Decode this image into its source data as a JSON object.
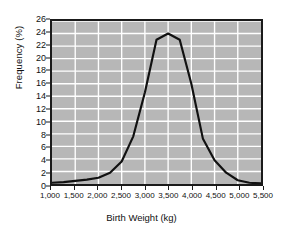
{
  "chart_data": {
    "type": "line",
    "title": "",
    "xlabel": "Birth Weight (kg)",
    "ylabel": "Frequency (%)",
    "xlim": [
      1000,
      5500
    ],
    "ylim": [
      0,
      26
    ],
    "xticks": [
      "1,000",
      "1,500",
      "2,000",
      "2,500",
      "3,000",
      "3,500",
      "4,000",
      "4,500",
      "5,000",
      "5,500"
    ],
    "xtick_values": [
      1000,
      1500,
      2000,
      2500,
      3000,
      3500,
      4000,
      4500,
      5000,
      5500
    ],
    "yticks": [
      "0",
      "2",
      "4",
      "6",
      "8",
      "10",
      "12",
      "14",
      "16",
      "18",
      "20",
      "22",
      "24",
      "26"
    ],
    "ytick_values": [
      0,
      2,
      4,
      6,
      8,
      10,
      12,
      14,
      16,
      18,
      20,
      22,
      24,
      26
    ],
    "grid": true,
    "grid_color": "#ffffff",
    "plot_background": "#b7b7b7",
    "line_color": "#111111",
    "legend": null,
    "x": [
      1000,
      1250,
      1500,
      1750,
      2000,
      2250,
      2500,
      2750,
      3000,
      3250,
      3500,
      3750,
      4000,
      4250,
      4500,
      4750,
      5000,
      5250,
      5500
    ],
    "values": [
      0.2,
      0.3,
      0.5,
      0.7,
      1.0,
      1.8,
      3.6,
      7.6,
      14.6,
      23.0,
      24.0,
      23.0,
      16.0,
      7.2,
      3.8,
      1.8,
      0.6,
      0.2,
      0.1
    ],
    "series": [
      {
        "name": "Birth weight distribution",
        "values": [
          0.2,
          0.3,
          0.5,
          0.7,
          1.0,
          1.8,
          3.6,
          7.6,
          14.6,
          23.0,
          24.0,
          23.0,
          16.0,
          7.2,
          3.8,
          1.8,
          0.6,
          0.2,
          0.1
        ]
      }
    ],
    "peak": {
      "x": 3500,
      "y": 24
    }
  }
}
